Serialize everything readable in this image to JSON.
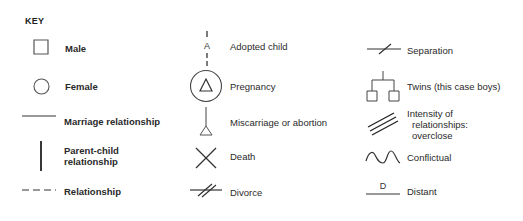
{
  "key": {
    "title": "KEY",
    "colors": {
      "ink": "#2a2a2a",
      "symbol_stroke": "#555555",
      "background": "#ffffff"
    },
    "columns": [
      {
        "items": [
          {
            "id": "male",
            "icon": "square-icon",
            "label": "Male"
          },
          {
            "id": "female",
            "icon": "circle-icon",
            "label": "Female"
          },
          {
            "id": "marriage",
            "icon": "solid-horizontal-line-icon",
            "label": "Marriage relationship"
          },
          {
            "id": "parent-child",
            "icon": "vertical-line-icon",
            "label_line1": "Parent-child",
            "label_line2": "relationship"
          },
          {
            "id": "relationship",
            "icon": "dashed-line-icon",
            "label": "Relationship"
          }
        ]
      },
      {
        "items": [
          {
            "id": "adopted",
            "icon": "dashed-vertical-A-icon",
            "glyph": "A",
            "label": "Adopted child"
          },
          {
            "id": "pregnancy",
            "icon": "triangle-in-circle-icon",
            "label": "Pregnancy"
          },
          {
            "id": "miscarriage",
            "icon": "line-with-triangle-icon",
            "label": "Miscarriage or abortion"
          },
          {
            "id": "death",
            "icon": "x-cross-icon",
            "label": "Death"
          },
          {
            "id": "divorce",
            "icon": "double-slash-line-icon",
            "label": "Divorce"
          }
        ]
      },
      {
        "items": [
          {
            "id": "separation",
            "icon": "single-slash-line-icon",
            "label": "Separation"
          },
          {
            "id": "twins",
            "icon": "twins-tree-icon",
            "label": "Twins (this case boys)"
          },
          {
            "id": "overclose",
            "icon": "triple-parallel-lines-icon",
            "label_line1": "Intensity of",
            "label_line2": "relationships:",
            "label_line3": "overclose"
          },
          {
            "id": "conflictual",
            "icon": "wavy-line-icon",
            "label": "Conflictual"
          },
          {
            "id": "distant",
            "icon": "line-with-D-icon",
            "glyph": "D",
            "label": "Distant"
          }
        ]
      }
    ]
  }
}
